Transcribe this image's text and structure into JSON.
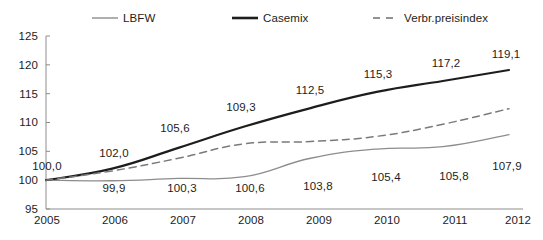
{
  "chart_data": {
    "type": "line",
    "title": "",
    "xlabel": "",
    "ylabel": "",
    "categories": [
      "2005",
      "2006",
      "2007",
      "2008",
      "2009",
      "2010",
      "2011",
      "2012"
    ],
    "ylim": [
      95,
      125
    ],
    "yticks": [
      "95",
      "100",
      "105",
      "110",
      "115",
      "120",
      "125"
    ],
    "grid": false,
    "legend_position": "top",
    "series": [
      {
        "name": "LBFW",
        "style": "solid-thin",
        "color": "#8d8d8d",
        "values": [
          100.0,
          99.9,
          100.3,
          100.6,
          103.8,
          105.4,
          105.8,
          107.9
        ],
        "labels": [
          "100,0",
          "99,9",
          "100,3",
          "100,6",
          "103,8",
          "105,4",
          "105,8",
          "107,9"
        ],
        "label_side": "below"
      },
      {
        "name": "Casemix",
        "style": "solid-thick",
        "color": "#1d1d1b",
        "values": [
          100.0,
          102.0,
          105.6,
          109.3,
          112.5,
          115.3,
          117.2,
          119.1
        ],
        "labels": [
          "100,0",
          "102,0",
          "105,6",
          "109,3",
          "112,5",
          "115,3",
          "117,2",
          "119,1"
        ],
        "label_side": "above"
      },
      {
        "name": "Verbr.preisindex",
        "style": "dashed",
        "color": "#8d8d8d",
        "values": [
          100.0,
          101.6,
          103.8,
          106.3,
          106.7,
          107.6,
          109.7,
          112.4
        ],
        "labels": [],
        "label_side": "none"
      }
    ]
  },
  "legend": {
    "items": [
      {
        "label": "LBFW",
        "swatch": "solid-thin-line-icon"
      },
      {
        "label": "Casemix",
        "swatch": "solid-thick-line-icon"
      },
      {
        "label": "Verbr.preisindex",
        "swatch": "dashed-line-icon"
      }
    ]
  },
  "axes": {
    "y": {
      "ticks": [
        "125",
        "120",
        "115",
        "110",
        "105",
        "100",
        "95"
      ]
    },
    "x": {
      "ticks": [
        "2005",
        "2006",
        "2007",
        "2008",
        "2009",
        "2010",
        "2011",
        "2012"
      ]
    }
  },
  "data_labels": {
    "casemix": [
      "100,0",
      "102,0",
      "105,6",
      "109,3",
      "112,5",
      "115,3",
      "117,2",
      "119,1"
    ],
    "lbfw": [
      "99,9",
      "100,3",
      "100,6",
      "103,8",
      "105,4",
      "105,8",
      "107,9"
    ]
  },
  "colors": {
    "text": "#1d1d1b",
    "axis": "#8d8d8d",
    "casemix": "#1d1d1b",
    "lbfw": "#8d8d8d",
    "verbr": "#8d8d8d",
    "background": "#ffffff"
  }
}
